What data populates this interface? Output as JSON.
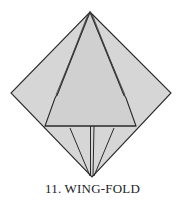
{
  "diagram": {
    "step_number": "11.",
    "step_name": "WING-FOLD",
    "caption": "11.  WING-FOLD",
    "colors": {
      "paper": "#d6d6d6",
      "outline": "#2a2a2a",
      "background": "#ffffff"
    }
  }
}
